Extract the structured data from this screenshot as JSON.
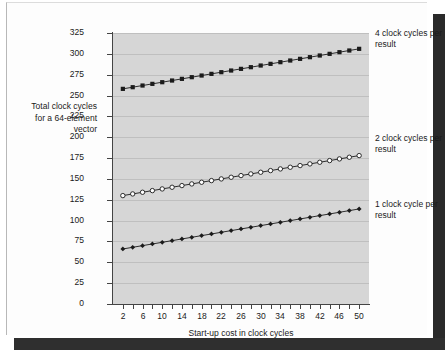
{
  "figure": {
    "y_axis_title": "Total clock cycles for a 64-element vector",
    "x_axis_title": "Start-up cost in clock cycles",
    "annotations": {
      "four_clock_cycles": "4 clock cycles per result",
      "two_clock_cycles": "2 clock cycles per result",
      "one_clock_cycle": "1 clock cycle per result"
    },
    "colors": {
      "plot_background": "#d6d6d6",
      "gridline": "#bfbfbf",
      "axis": "#444444",
      "series": "#1a1a1a",
      "page": "#fdfdfd",
      "page_shadow": "#2a2a2a"
    }
  },
  "chart_data": {
    "type": "line",
    "title": "",
    "xlabel": "Start-up cost in clock cycles",
    "ylabel": "Total clock cycles for a 64-element vector",
    "xlim": [
      0,
      52
    ],
    "ylim": [
      0,
      325
    ],
    "grid": true,
    "legend_position": "right-inline-annotations",
    "x": [
      2,
      4,
      6,
      8,
      10,
      12,
      14,
      16,
      18,
      20,
      22,
      24,
      26,
      28,
      30,
      32,
      34,
      36,
      38,
      40,
      42,
      44,
      46,
      48,
      50
    ],
    "x_tick_values": [
      2,
      4,
      6,
      8,
      10,
      12,
      14,
      16,
      18,
      20,
      22,
      24,
      26,
      28,
      30,
      32,
      34,
      36,
      38,
      40,
      42,
      44,
      46,
      48,
      50
    ],
    "x_tick_labels": [
      "2",
      "",
      "6",
      "",
      "10",
      "",
      "14",
      "",
      "18",
      "",
      "22",
      "",
      "26",
      "",
      "30",
      "",
      "34",
      "",
      "38",
      "",
      "42",
      "",
      "46",
      "",
      "50"
    ],
    "y_ticks": [
      0,
      25,
      50,
      75,
      100,
      125,
      150,
      175,
      200,
      225,
      250,
      275,
      300,
      325
    ],
    "y_tick_labels": [
      "0",
      "25",
      "50",
      "75",
      "100",
      "125",
      "150",
      "175",
      "200",
      "225",
      "250",
      "275",
      "300",
      "325"
    ],
    "series": [
      {
        "name": "4 clock cycles per result",
        "marker": "filled-square",
        "values": [
          258,
          260,
          262,
          264,
          266,
          268,
          270,
          272,
          274,
          276,
          278,
          280,
          282,
          284,
          286,
          288,
          290,
          292,
          294,
          296,
          298,
          300,
          302,
          304,
          306
        ]
      },
      {
        "name": "2 clock cycles per result",
        "marker": "open-circle",
        "values": [
          130,
          132,
          134,
          136,
          138,
          140,
          142,
          144,
          146,
          148,
          150,
          152,
          154,
          156,
          158,
          160,
          162,
          164,
          166,
          168,
          170,
          172,
          174,
          176,
          178
        ]
      },
      {
        "name": "1 clock cycle per result",
        "marker": "filled-diamond",
        "values": [
          66,
          68,
          70,
          72,
          74,
          76,
          78,
          80,
          82,
          84,
          86,
          88,
          90,
          92,
          94,
          96,
          98,
          100,
          102,
          104,
          106,
          108,
          110,
          112,
          114
        ]
      }
    ]
  }
}
